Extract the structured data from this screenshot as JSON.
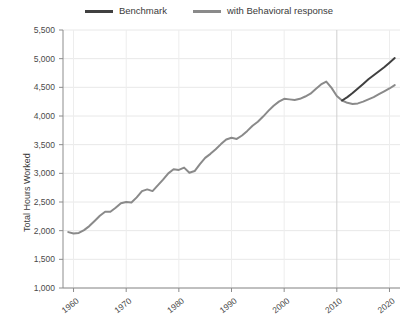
{
  "chart_data": {
    "type": "line",
    "title": "",
    "xlabel": "",
    "ylabel": "Total Hours Worked",
    "xlim": [
      1958,
      2022
    ],
    "ylim": [
      1000,
      5500
    ],
    "xticks": [
      1960,
      1970,
      1980,
      1990,
      2000,
      2010,
      2020
    ],
    "yticks": [
      1000,
      1500,
      2000,
      2500,
      3000,
      3500,
      4000,
      4500,
      5000,
      5500
    ],
    "ytick_labels": [
      "1,000",
      "1,500",
      "2,000",
      "2,500",
      "3,000",
      "3,500",
      "4,000",
      "4,500",
      "5,000",
      "5,500"
    ],
    "xtick_labels": [
      "1960",
      "1970",
      "1980",
      "1990",
      "2000",
      "2010",
      "2020"
    ],
    "grid": true,
    "legend_position": "top-center",
    "series": [
      {
        "name": "Benchmark",
        "color": "#404040",
        "x": [
          2011,
          2012,
          2013,
          2014,
          2015,
          2016,
          2017,
          2018,
          2019,
          2020,
          2021
        ],
        "values": [
          4270,
          4330,
          4400,
          4480,
          4560,
          4640,
          4710,
          4780,
          4850,
          4930,
          5010
        ]
      },
      {
        "name": "with Behavioral response",
        "color": "#8a8a8a",
        "x": [
          1959,
          1960,
          1961,
          1962,
          1963,
          1964,
          1965,
          1966,
          1967,
          1968,
          1969,
          1970,
          1971,
          1972,
          1973,
          1974,
          1975,
          1976,
          1977,
          1978,
          1979,
          1980,
          1981,
          1982,
          1983,
          1984,
          1985,
          1986,
          1987,
          1988,
          1989,
          1990,
          1991,
          1992,
          1993,
          1994,
          1995,
          1996,
          1997,
          1998,
          1999,
          2000,
          2001,
          2002,
          2003,
          2004,
          2005,
          2006,
          2007,
          2008,
          2009,
          2010,
          2011,
          2012,
          2013,
          2014,
          2015,
          2016,
          2017,
          2018,
          2019,
          2020,
          2021
        ],
        "values": [
          1975,
          1950,
          1960,
          2010,
          2080,
          2170,
          2260,
          2330,
          2330,
          2400,
          2480,
          2500,
          2490,
          2580,
          2690,
          2720,
          2690,
          2790,
          2890,
          3000,
          3070,
          3060,
          3100,
          3010,
          3040,
          3160,
          3270,
          3340,
          3420,
          3510,
          3590,
          3620,
          3600,
          3660,
          3740,
          3830,
          3900,
          3990,
          4090,
          4180,
          4250,
          4300,
          4290,
          4280,
          4300,
          4340,
          4390,
          4470,
          4550,
          4600,
          4490,
          4350,
          4270,
          4230,
          4210,
          4220,
          4250,
          4290,
          4330,
          4380,
          4430,
          4480,
          4540
        ]
      }
    ]
  },
  "legend": {
    "items": [
      {
        "label": "Benchmark",
        "color": "#404040"
      },
      {
        "label": "with Behavioral response",
        "color": "#8a8a8a"
      }
    ]
  },
  "axes": {
    "y_title": "Total Hours Worked"
  }
}
